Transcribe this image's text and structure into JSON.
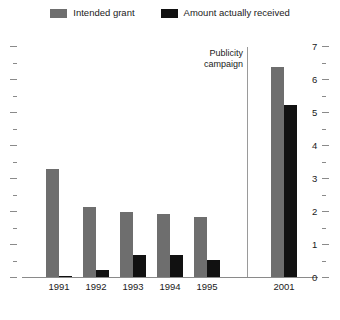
{
  "chart_data": {
    "type": "bar",
    "title": "",
    "subtitle": "",
    "xlabel": "",
    "ylabel": "",
    "categories": [
      "1991",
      "1992",
      "1993",
      "1994",
      "1995",
      "2001"
    ],
    "series": [
      {
        "name": "Intended grant",
        "color": "#6e6e6e",
        "values": [
          3.3,
          2.15,
          2.0,
          1.95,
          1.85,
          6.4
        ]
      },
      {
        "name": "Amount actually received",
        "color": "#111111",
        "values": [
          0.05,
          0.25,
          0.7,
          0.7,
          0.55,
          5.25
        ]
      }
    ],
    "ylim": [
      0,
      7
    ],
    "ymajor_step": 1,
    "yminor_step": 0.5,
    "yticks": [
      0,
      1,
      2,
      3,
      4,
      5,
      6,
      7
    ],
    "ytick_labels": [
      "0",
      "1",
      "2",
      "3",
      "4",
      "5",
      "6",
      "7"
    ],
    "ytick_labels_side": "right",
    "left_axis_ticks_only": true,
    "grid": false,
    "legend_position": "top-center",
    "annotations": [
      {
        "name": "publicity-campaign",
        "lines": [
          "Publicity",
          "campaign"
        ],
        "between_categories": [
          "1995",
          "2001"
        ]
      }
    ],
    "divider_after_category": "1995"
  },
  "legend": {
    "entries": [
      {
        "label": "Intended grant",
        "swatch": "grant-swatch"
      },
      {
        "label": "Amount actually received",
        "swatch": "received-swatch"
      }
    ]
  },
  "annotation": {
    "line1": "Publicity",
    "line2": "campaign"
  },
  "colors": {
    "grant": "#6e6e6e",
    "received": "#111111",
    "axis": "#8a8a8a",
    "divider": "#9a9a9a",
    "text": "#1a1a1a",
    "background": "#ffffff"
  }
}
